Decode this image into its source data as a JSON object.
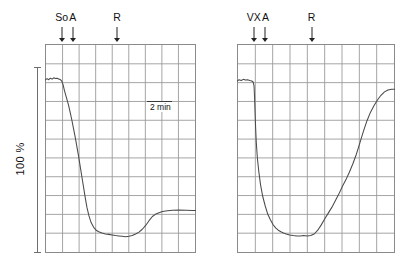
{
  "figure": {
    "width": 417,
    "height": 269,
    "background": "#ffffff",
    "trace_color": "#4a4a4a",
    "grid_color": "#9a9a9a",
    "frame_color": "#8a8a8a",
    "axis_color": "#6e6e6e"
  },
  "y_axis": {
    "label": "100 %",
    "bar_top_y": 67,
    "bar_bottom_y": 253
  },
  "time_scale": {
    "label": "2 min",
    "x": 147,
    "y": 101,
    "width": 25
  },
  "chart_data": {
    "type": "line",
    "title": "",
    "xlabel": "",
    "ylabel": "100 %",
    "panels": [
      {
        "id": "left-panel",
        "name": "so-a-r-trace",
        "plot_box": {
          "x": 45,
          "y": 44,
          "width": 151,
          "height": 209
        },
        "grid": {
          "columns": 9,
          "rows": 11,
          "visible": true
        },
        "xlim": [
          0,
          9
        ],
        "ylim": [
          0,
          11
        ],
        "markers": [
          {
            "label": "So",
            "x": 1.0
          },
          {
            "label": "A",
            "x": 1.65
          },
          {
            "label": "R",
            "x": 4.3
          }
        ],
        "series": [
          {
            "name": "response",
            "x": [
              0.0,
              0.12,
              0.22,
              0.32,
              0.42,
              0.52,
              0.62,
              0.72,
              0.82,
              0.92,
              1.0,
              1.08,
              1.16,
              1.24,
              1.32,
              1.4,
              1.5,
              1.6,
              1.7,
              1.8,
              1.9,
              2.0,
              2.1,
              2.2,
              2.3,
              2.4,
              2.5,
              2.62,
              2.75,
              2.9,
              3.05,
              3.2,
              3.4,
              3.6,
              3.8,
              4.0,
              4.2,
              4.4,
              4.6,
              4.8,
              5.0,
              5.2,
              5.4,
              5.6,
              5.8,
              6.0,
              6.2,
              6.4,
              6.6,
              6.8,
              7.0,
              7.3,
              7.6,
              8.0,
              8.4,
              8.8,
              9.0
            ],
            "y": [
              9.1,
              9.18,
              9.12,
              9.2,
              9.15,
              9.22,
              9.18,
              9.2,
              9.16,
              9.12,
              9.05,
              8.85,
              8.55,
              8.3,
              8.05,
              7.8,
              7.4,
              7.0,
              6.55,
              6.1,
              5.6,
              5.1,
              4.55,
              4.0,
              3.45,
              2.9,
              2.4,
              1.95,
              1.6,
              1.35,
              1.2,
              1.12,
              1.05,
              1.0,
              0.98,
              0.95,
              0.92,
              0.9,
              0.88,
              0.86,
              0.88,
              0.92,
              1.0,
              1.1,
              1.25,
              1.45,
              1.7,
              1.92,
              2.05,
              2.12,
              2.18,
              2.22,
              2.25,
              2.26,
              2.25,
              2.24,
              2.24
            ]
          }
        ]
      },
      {
        "id": "right-panel",
        "name": "vx-a-r-trace",
        "plot_box": {
          "x": 237,
          "y": 44,
          "width": 158,
          "height": 209
        },
        "grid": {
          "columns": 9,
          "rows": 11,
          "visible": true
        },
        "xlim": [
          0,
          9
        ],
        "ylim": [
          0,
          11
        ],
        "markers": [
          {
            "label": "VX",
            "x": 0.95
          },
          {
            "label": "A",
            "x": 1.62
          },
          {
            "label": "R",
            "x": 4.25
          }
        ],
        "series": [
          {
            "name": "response",
            "x": [
              0.0,
              0.12,
              0.24,
              0.36,
              0.48,
              0.6,
              0.72,
              0.84,
              0.92,
              0.97,
              1.0,
              1.03,
              1.06,
              1.1,
              1.16,
              1.24,
              1.34,
              1.46,
              1.6,
              1.75,
              1.9,
              2.05,
              2.2,
              2.35,
              2.5,
              2.65,
              2.8,
              3.0,
              3.2,
              3.4,
              3.6,
              3.8,
              4.0,
              4.2,
              4.4,
              4.6,
              4.8,
              5.0,
              5.2,
              5.4,
              5.6,
              5.8,
              6.0,
              6.2,
              6.4,
              6.6,
              6.8,
              7.0,
              7.2,
              7.4,
              7.6,
              7.8,
              8.0,
              8.2,
              8.4,
              8.6,
              8.8,
              9.0
            ],
            "y": [
              9.05,
              9.12,
              9.08,
              9.14,
              9.1,
              9.12,
              9.08,
              9.05,
              9.0,
              8.8,
              8.2,
              7.4,
              6.6,
              5.8,
              5.0,
              4.3,
              3.6,
              3.0,
              2.5,
              2.05,
              1.75,
              1.5,
              1.32,
              1.2,
              1.12,
              1.05,
              1.0,
              0.95,
              0.92,
              0.9,
              0.9,
              0.92,
              0.9,
              0.92,
              1.0,
              1.2,
              1.48,
              1.8,
              2.1,
              2.4,
              2.75,
              3.1,
              3.5,
              3.85,
              4.25,
              4.7,
              5.2,
              5.8,
              6.4,
              6.95,
              7.4,
              7.75,
              8.05,
              8.3,
              8.48,
              8.58,
              8.62,
              8.62
            ]
          }
        ]
      }
    ]
  }
}
